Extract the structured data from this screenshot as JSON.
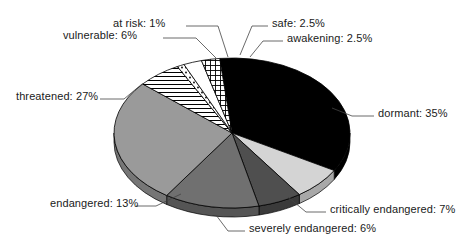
{
  "chart_data": {
    "type": "pie",
    "title": "",
    "subtitle": "",
    "xlabel": "",
    "ylabel": "",
    "legend_position": "none",
    "grid": false,
    "style": "3d-exploded-greyscale",
    "units": "percent",
    "total": 100,
    "categories": [
      "dormant",
      "critically endangered",
      "severely endangered",
      "endangered",
      "threatened",
      "vulnerable",
      "at risk",
      "safe",
      "awakening"
    ],
    "values": [
      35,
      7,
      6,
      13,
      27,
      6,
      1,
      2.5,
      2.5
    ],
    "slices": [
      {
        "name": "dormant",
        "value": 35,
        "label": "dormant: 35%",
        "fill": "#000000",
        "pattern": "solid",
        "side": "#000000"
      },
      {
        "name": "critically endangered",
        "value": 7,
        "label": "critically endangered: 7%",
        "fill": "#d4d4d4",
        "pattern": "solid",
        "side": "#a8a8a8"
      },
      {
        "name": "severely endangered",
        "value": 6,
        "label": "severely endangered: 6%",
        "fill": "#4f4f4f",
        "pattern": "solid",
        "side": "#3a3a3a"
      },
      {
        "name": "endangered",
        "value": 13,
        "label": "endangered: 13%",
        "fill": "#707070",
        "pattern": "solid",
        "side": "#555555"
      },
      {
        "name": "threatened",
        "value": 27,
        "label": "threatened: 27%",
        "fill": "#9a9a9a",
        "pattern": "solid",
        "side": "#767676"
      },
      {
        "name": "vulnerable",
        "value": 6,
        "label": "vulnerable: 6%",
        "fill": "#ffffff",
        "pattern": "horizontal-lines",
        "side": "#c8c8c8"
      },
      {
        "name": "at risk",
        "value": 1,
        "label": "at risk: 1%",
        "fill": "#ffffff",
        "pattern": "dotted",
        "side": "#c8c8c8"
      },
      {
        "name": "safe",
        "value": 2.5,
        "label": "safe: 2.5%",
        "fill": "#ffffff",
        "pattern": "none",
        "side": "#c8c8c8"
      },
      {
        "name": "awakening",
        "value": 2.5,
        "label": "awakening: 2.5%",
        "fill": "#ffffff",
        "pattern": "cross-hatch",
        "side": "#c8c8c8"
      }
    ]
  },
  "labels": {
    "at_risk": "at risk: 1%",
    "safe": "safe: 2.5%",
    "vulnerable": "vulnerable: 6%",
    "awakening": "awakening: 2.5%",
    "threatened": "threatened: 27%",
    "dormant": "dormant: 35%",
    "endangered": "endangered: 13%",
    "critically_endangered": "critically endangered: 7%",
    "severely_endangered": "severely endangered: 6%"
  }
}
